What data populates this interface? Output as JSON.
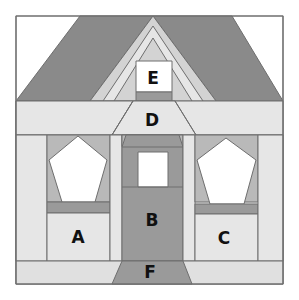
{
  "colors": {
    "white": "#ffffff",
    "light": "#e6e6e6",
    "medium_light": "#d3d3d3",
    "medium": "#b9b9b9",
    "dark": "#8f8f8f",
    "roof": "#8a8a8a",
    "outline": "#6e6e6e"
  },
  "labels": {
    "A": "A",
    "B": "B",
    "C": "C",
    "D": "D",
    "E": "E",
    "F": "F"
  }
}
